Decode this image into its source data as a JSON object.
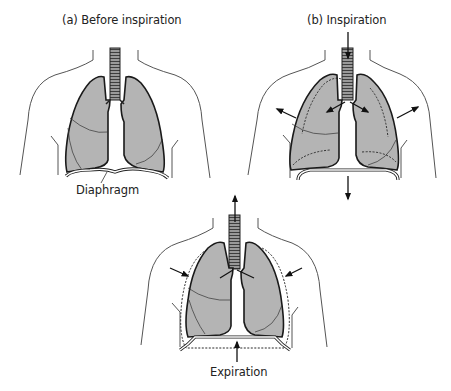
{
  "diagram": {
    "type": "anatomical-illustration",
    "panels": [
      {
        "id": "a",
        "title": "(a) Before inspiration",
        "labels": [
          "Diaphragm"
        ],
        "arrows": []
      },
      {
        "id": "b",
        "title": "(b) Inspiration",
        "labels": [],
        "arrows": [
          "air-in-down-trachea",
          "chest-wall-outward-left",
          "chest-wall-outward-right",
          "bronchi-left",
          "bronchi-right",
          "diaphragm-down"
        ]
      },
      {
        "id": "c",
        "title": "Expiration",
        "labels": [],
        "arrows": [
          "air-out-up-trachea",
          "chest-wall-inward-left",
          "chest-wall-inward-right",
          "diaphragm-up"
        ]
      }
    ]
  },
  "colors": {
    "lung_fill": "#b4b4b4",
    "outline": "#1a1a1a",
    "body_line": "#555555",
    "background": "#ffffff"
  }
}
